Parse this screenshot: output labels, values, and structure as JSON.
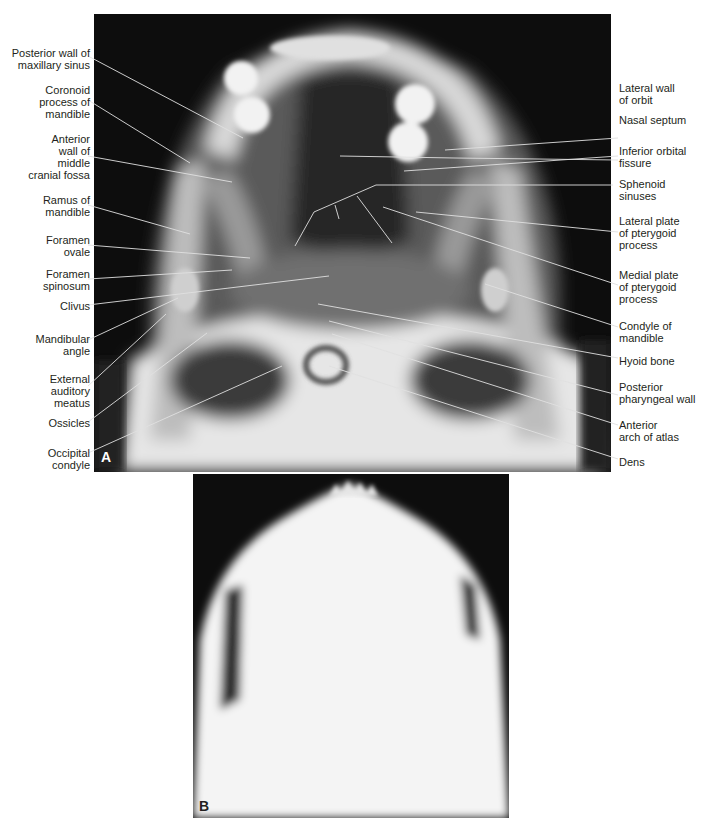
{
  "figure": {
    "panels": [
      {
        "id": "A",
        "letter": "A",
        "description": "Submentovertex radiograph of skull base, well-penetrated"
      },
      {
        "id": "B",
        "letter": "B",
        "description": "Submentovertex radiograph, underpenetrated/overexposed"
      }
    ],
    "colors": {
      "label_text": "#231f20",
      "leader_line": "#d9d9d9",
      "film_dark": "#0d0d0d",
      "bone_light": "#f2f2f2"
    }
  },
  "labels_left": [
    {
      "id": "posterior-wall-maxillary-sinus",
      "text": "Posterior wall of\nmaxillary sinus"
    },
    {
      "id": "coronoid-process",
      "text": "Coronoid\nprocess of\nmandible"
    },
    {
      "id": "anterior-wall-middle-cranial-fossa",
      "text": "Anterior\nwall of\nmiddle\ncranial fossa"
    },
    {
      "id": "ramus-of-mandible",
      "text": "Ramus of\nmandible"
    },
    {
      "id": "foramen-ovale",
      "text": "Foramen\novale"
    },
    {
      "id": "foramen-spinosum",
      "text": "Foramen\nspinosum"
    },
    {
      "id": "clivus",
      "text": "Clivus"
    },
    {
      "id": "mandibular-angle",
      "text": "Mandibular\nangle"
    },
    {
      "id": "external-auditory-meatus",
      "text": "External\nauditory\nmeatus"
    },
    {
      "id": "ossicles",
      "text": "Ossicles"
    },
    {
      "id": "occipital-condyle",
      "text": "Occipital\ncondyle"
    }
  ],
  "labels_right": [
    {
      "id": "lateral-wall-of-orbit",
      "text": "Lateral wall\nof orbit"
    },
    {
      "id": "nasal-septum",
      "text": "Nasal septum"
    },
    {
      "id": "inferior-orbital-fissure",
      "text": "Inferior orbital\nfissure"
    },
    {
      "id": "sphenoid-sinuses",
      "text": "Sphenoid\nsinuses"
    },
    {
      "id": "lateral-plate-pterygoid",
      "text": "Lateral plate\nof pterygoid\nprocess"
    },
    {
      "id": "medial-plate-pterygoid",
      "text": "Medial plate\nof pterygoid\nprocess"
    },
    {
      "id": "condyle-of-mandible",
      "text": "Condyle of\nmandible"
    },
    {
      "id": "hyoid-bone",
      "text": "Hyoid bone"
    },
    {
      "id": "posterior-pharyngeal-wall",
      "text": "Posterior\npharyngeal wall"
    },
    {
      "id": "anterior-arch-of-atlas",
      "text": "Anterior\narch of atlas"
    },
    {
      "id": "dens",
      "text": "Dens"
    }
  ]
}
